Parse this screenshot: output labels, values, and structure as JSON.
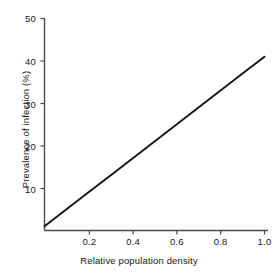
{
  "chart_data": {
    "type": "line",
    "title": "",
    "xlabel": "Relative population density",
    "ylabel": "Prevalence of infection (%)",
    "xlim": [
      0,
      1.07
    ],
    "ylim": [
      0,
      50
    ],
    "grid": false,
    "legend": null,
    "xticks": [
      0.2,
      0.4,
      0.6,
      0.8,
      1.0
    ],
    "xtick_labels": [
      "0.2",
      "0.4",
      "0.6",
      "0.8",
      "1.0"
    ],
    "yticks": [
      10,
      20,
      30,
      40,
      50
    ],
    "ytick_labels": [
      "10",
      "20",
      "30",
      "40",
      "50"
    ],
    "series": [
      {
        "name": "prevalence",
        "color": "#141414",
        "line_width": 1.9,
        "x": [
          0.0,
          0.1,
          0.2,
          0.3,
          0.4,
          0.5,
          0.6,
          0.7,
          0.8,
          0.9,
          1.0
        ],
        "values": [
          1.0,
          5.0,
          9.0,
          13.0,
          17.0,
          21.0,
          25.0,
          29.0,
          33.0,
          37.0,
          41.0
        ]
      }
    ]
  },
  "axes": {
    "axis_color": "#4a4a4a",
    "tick_color": "#4a4a4a"
  }
}
